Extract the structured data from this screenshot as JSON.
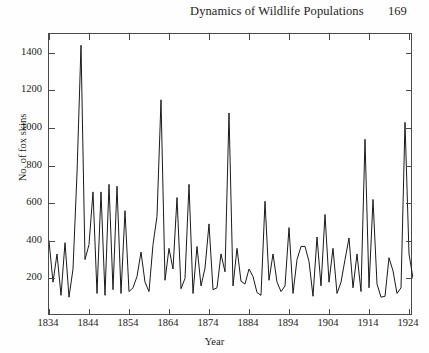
{
  "running_head": {
    "book_title": "Dynamics of Wildlife Populations",
    "page_number": "169"
  },
  "figure": {
    "caption": ""
  },
  "chart_data": {
    "type": "line",
    "title": "",
    "xlabel": "Year",
    "ylabel": "No. of fox skins",
    "xlim": [
      1834,
      1925
    ],
    "ylim": [
      0,
      1500
    ],
    "xticks": [
      1834,
      1844,
      1854,
      1864,
      1874,
      1884,
      1894,
      1904,
      1914,
      1924
    ],
    "yticks": [
      200,
      400,
      600,
      800,
      1000,
      1200,
      1400
    ],
    "grid": false,
    "legend": "none",
    "line_color": "#1a1a1a",
    "x": [
      1834,
      1835,
      1836,
      1837,
      1838,
      1839,
      1840,
      1841,
      1842,
      1843,
      1844,
      1845,
      1846,
      1847,
      1848,
      1849,
      1850,
      1851,
      1852,
      1853,
      1854,
      1855,
      1856,
      1857,
      1858,
      1859,
      1860,
      1861,
      1862,
      1863,
      1864,
      1865,
      1866,
      1867,
      1868,
      1869,
      1870,
      1871,
      1872,
      1873,
      1874,
      1875,
      1876,
      1877,
      1878,
      1879,
      1880,
      1881,
      1882,
      1883,
      1884,
      1885,
      1886,
      1887,
      1888,
      1889,
      1890,
      1891,
      1892,
      1893,
      1894,
      1895,
      1896,
      1897,
      1898,
      1899,
      1900,
      1901,
      1902,
      1903,
      1904,
      1905,
      1906,
      1907,
      1908,
      1909,
      1910,
      1911,
      1912,
      1913,
      1914,
      1915,
      1916,
      1917,
      1918,
      1919,
      1920,
      1921,
      1922,
      1923,
      1924,
      1925
    ],
    "y": [
      400,
      180,
      330,
      110,
      390,
      100,
      250,
      760,
      1440,
      300,
      380,
      660,
      120,
      660,
      110,
      700,
      140,
      690,
      120,
      560,
      130,
      150,
      210,
      340,
      180,
      130,
      380,
      530,
      1150,
      190,
      360,
      250,
      630,
      145,
      200,
      700,
      120,
      370,
      160,
      255,
      490,
      140,
      150,
      330,
      235,
      1080,
      160,
      360,
      185,
      170,
      250,
      210,
      125,
      110,
      610,
      190,
      330,
      180,
      130,
      160,
      470,
      120,
      300,
      370,
      370,
      290,
      105,
      420,
      160,
      540,
      180,
      360,
      120,
      180,
      300,
      415,
      150,
      330,
      130,
      940,
      150,
      620,
      170,
      100,
      105,
      310,
      240,
      120,
      150,
      1030,
      330,
      200
    ],
    "series": [
      {
        "name": "Fox skins",
        "values": [
          400,
          180,
          330,
          110,
          390,
          100,
          250,
          760,
          1440,
          300,
          380,
          660,
          120,
          660,
          110,
          700,
          140,
          690,
          120,
          560,
          130,
          150,
          210,
          340,
          180,
          130,
          380,
          530,
          1150,
          190,
          360,
          250,
          630,
          145,
          200,
          700,
          120,
          370,
          160,
          255,
          490,
          140,
          150,
          330,
          235,
          1080,
          160,
          360,
          185,
          170,
          250,
          210,
          125,
          110,
          610,
          190,
          330,
          180,
          130,
          160,
          470,
          120,
          300,
          370,
          370,
          290,
          105,
          420,
          160,
          540,
          180,
          360,
          120,
          180,
          300,
          415,
          150,
          330,
          130,
          940,
          150,
          620,
          170,
          100,
          105,
          310,
          240,
          120,
          150,
          1030,
          330,
          200
        ]
      }
    ]
  }
}
